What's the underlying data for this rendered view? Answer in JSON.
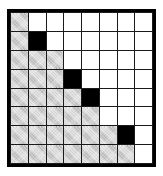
{
  "diagram": {
    "type": "grid-matrix",
    "rows": 8,
    "columns": 8,
    "legend": {
      "gray_label": "shaded cell",
      "black_label": "filled cell",
      "white_label": "empty cell"
    },
    "colors": {
      "border": "#000000",
      "gridline": "#1a1a1a",
      "gray_fill": "#cfcfcf",
      "black_fill": "#000000",
      "white_fill": "#ffffff",
      "page_background": "#ffffff"
    },
    "cells": [
      [
        "gray",
        "white",
        "white",
        "white",
        "white",
        "white",
        "white",
        "white"
      ],
      [
        "gray",
        "black",
        "white",
        "white",
        "white",
        "white",
        "white",
        "white"
      ],
      [
        "gray",
        "gray",
        "gray",
        "white",
        "white",
        "white",
        "white",
        "white"
      ],
      [
        "gray",
        "gray",
        "gray",
        "black",
        "white",
        "white",
        "white",
        "white"
      ],
      [
        "gray",
        "gray",
        "gray",
        "gray",
        "black",
        "white",
        "white",
        "white"
      ],
      [
        "gray",
        "gray",
        "gray",
        "gray",
        "gray",
        "white",
        "white",
        "white"
      ],
      [
        "gray",
        "gray",
        "gray",
        "gray",
        "gray",
        "gray",
        "black",
        "white"
      ],
      [
        "gray",
        "gray",
        "gray",
        "gray",
        "gray",
        "gray",
        "gray",
        "white"
      ]
    ]
  }
}
